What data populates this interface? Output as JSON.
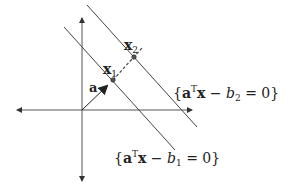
{
  "diagram": {
    "type": "hyperplanes",
    "colors": {
      "axis": "#555555",
      "line": "#444444",
      "vector": "#222222",
      "point": "#333333",
      "text": "#222222"
    },
    "labels": {
      "vector_a": "a",
      "point_x1": "x",
      "point_x1_sub": "1",
      "point_x2": "x",
      "point_x2_sub": "2",
      "plane2": {
        "open": "{",
        "a": "a",
        "sup": "T",
        "x": "x",
        "minus": " − ",
        "b": "b",
        "sub": "2",
        "rest": " = 0}"
      },
      "plane1": {
        "open": "{",
        "a": "a",
        "sup": "T",
        "x": "x",
        "minus": " − ",
        "b": "b",
        "sub": "1",
        "rest": " = 0}"
      }
    }
  }
}
